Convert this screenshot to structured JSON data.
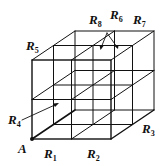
{
  "figure": {
    "point_label": "A",
    "region_labels": [
      {
        "id": "R1",
        "base": "R",
        "sub": "1"
      },
      {
        "id": "R2",
        "base": "R",
        "sub": "2"
      },
      {
        "id": "R3",
        "base": "R",
        "sub": "3"
      },
      {
        "id": "R4",
        "base": "R",
        "sub": "4"
      },
      {
        "id": "R5",
        "base": "R",
        "sub": "5"
      },
      {
        "id": "R6",
        "base": "R",
        "sub": "6"
      },
      {
        "id": "R7",
        "base": "R",
        "sub": "7"
      },
      {
        "id": "R8",
        "base": "R",
        "sub": "8"
      }
    ],
    "line_color": "#111111"
  }
}
